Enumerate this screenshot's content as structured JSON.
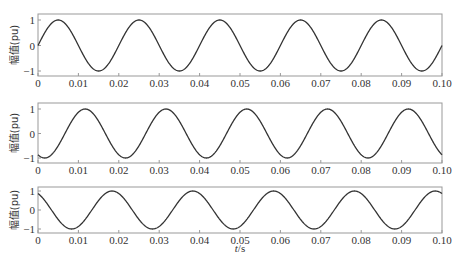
{
  "chart_data": [
    {
      "type": "line",
      "panel": 1,
      "title": "",
      "xlabel": "",
      "ylabel": "幅值(pu)",
      "xlim": [
        0,
        0.1
      ],
      "ylim": [
        -1,
        1
      ],
      "x_ticks": [
        "0",
        "0.01",
        "0.02",
        "0.03",
        "0.04",
        "0.05",
        "0.06",
        "0.07",
        "0.08",
        "0.09",
        "0.10"
      ],
      "y_ticks": [
        "-1",
        "0",
        "1"
      ],
      "grid": false,
      "series": [
        {
          "name": "phase A",
          "function": "sin(2*pi*50*t)",
          "frequency_hz": 50,
          "amplitude": 1,
          "phase_deg": 0,
          "x": [
            0,
            0.005,
            0.01,
            0.015,
            0.02,
            0.025,
            0.03,
            0.035,
            0.04,
            0.045,
            0.05,
            0.055,
            0.06,
            0.065,
            0.07,
            0.075,
            0.08,
            0.085,
            0.09,
            0.095,
            0.1
          ],
          "y": [
            0,
            1,
            0,
            -1,
            0,
            1,
            0,
            -1,
            0,
            1,
            0,
            -1,
            0,
            1,
            0,
            -1,
            0,
            1,
            0,
            -1,
            0
          ]
        }
      ]
    },
    {
      "type": "line",
      "panel": 2,
      "title": "",
      "xlabel": "",
      "ylabel": "幅值(pu)",
      "xlim": [
        0,
        0.1
      ],
      "ylim": [
        -1,
        1
      ],
      "x_ticks": [
        "0",
        "0.01",
        "0.02",
        "0.03",
        "0.04",
        "0.05",
        "0.06",
        "0.07",
        "0.08",
        "0.09",
        "0.10"
      ],
      "y_ticks": [
        "-1",
        "0",
        "1"
      ],
      "grid": false,
      "series": [
        {
          "name": "phase B",
          "function": "sin(2*pi*50*t - 120deg)",
          "frequency_hz": 50,
          "amplitude": 1,
          "phase_deg": -120,
          "x": [
            0,
            0.00167,
            0.00667,
            0.01167,
            0.01667,
            0.02167,
            0.04167,
            0.06167,
            0.08167,
            0.09167,
            0.1
          ],
          "y": [
            -0.866,
            -1,
            0,
            1,
            0,
            -1,
            -1,
            -1,
            -1,
            1,
            -0.866
          ]
        }
      ]
    },
    {
      "type": "line",
      "panel": 3,
      "title": "",
      "xlabel": "t/s",
      "ylabel": "幅值(pu)",
      "xlim": [
        0,
        0.1
      ],
      "ylim": [
        -1,
        1
      ],
      "x_ticks": [
        "0",
        "0.01",
        "0.02",
        "0.03",
        "0.04",
        "0.05",
        "0.06",
        "0.07",
        "0.08",
        "0.09",
        "0.10"
      ],
      "y_ticks": [
        "-1",
        "0",
        "1"
      ],
      "grid": false,
      "series": [
        {
          "name": "phase C",
          "function": "sin(2*pi*50*t + 120deg)",
          "frequency_hz": 50,
          "amplitude": 1,
          "phase_deg": 120,
          "x": [
            0,
            0.00333,
            0.00833,
            0.01333,
            0.01833,
            0.02833,
            0.03833,
            0.04833,
            0.05833,
            0.06833,
            0.07833,
            0.08833,
            0.09833,
            0.1
          ],
          "y": [
            0.866,
            0,
            -1,
            0,
            1,
            -1,
            1,
            -1,
            1,
            -1,
            1,
            -1,
            1,
            0.866
          ]
        }
      ]
    }
  ],
  "panels": [
    {
      "ylabel": "幅值(pu)",
      "phase_deg": 0
    },
    {
      "ylabel": "幅值(pu)",
      "phase_deg": -120
    },
    {
      "ylabel": "幅值(pu)",
      "phase_deg": 120
    }
  ],
  "x_ticks": [
    "0",
    "0.01",
    "0.02",
    "0.03",
    "0.04",
    "0.05",
    "0.06",
    "0.07",
    "0.08",
    "0.09",
    "0.10"
  ],
  "y_ticks": [
    "-1",
    "0",
    "1"
  ],
  "xlabel": "t/s",
  "frequency_hz": 50,
  "colors": {
    "line": "#333333",
    "axes": "#999999",
    "text": "#333333"
  }
}
